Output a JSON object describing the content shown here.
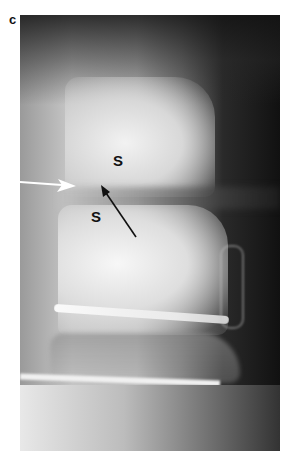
{
  "figure": {
    "panel_label": "c",
    "annotations": {
      "upper_vertebra_label": "S",
      "lower_vertebra_label": "S",
      "white_arrow": "points right toward disc space (anterior)",
      "black_arrow": "points up-left toward disc space"
    }
  }
}
